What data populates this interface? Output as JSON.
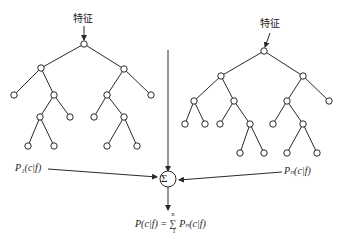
{
  "diagram": {
    "type": "random-forest-ensemble",
    "trees": [
      {
        "feature_label": "特征",
        "output_label": "P₁(c|f)"
      },
      {
        "feature_label": "特征",
        "output_label": "Pₙ(c|f)"
      }
    ],
    "combiner": {
      "symbol": "Σ"
    },
    "result": {
      "formula": "P(c|f) =∑ Pₙ(c|f)",
      "lhs": "P(c|f) =",
      "sum_upper": "n",
      "sum_lower": "1",
      "rhs": "Pₙ(c|f)"
    }
  },
  "colors": {
    "stroke": "#2a2a2a",
    "background": "#ffffff"
  }
}
